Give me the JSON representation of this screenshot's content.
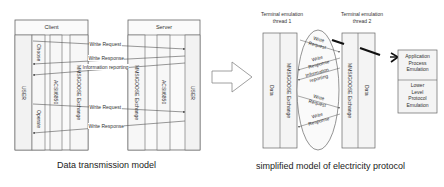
{
  "left_diagram": {
    "client": {
      "title": "Client",
      "columns": [
        "USER",
        "Choose",
        "Operate",
        "ACSI/6850",
        "MMS/GOOSE Exchange"
      ]
    },
    "server": {
      "title": "Server",
      "columns": [
        "MMS/GOOSE Exchange",
        "ACSI/6850",
        "USER"
      ]
    },
    "messages": [
      {
        "label": "Write Request",
        "direction": "client-to-server"
      },
      {
        "label": "Write Response",
        "direction": "server-to-client"
      },
      {
        "label": "Information reporting",
        "direction": "server-to-client"
      },
      {
        "label": "Write Request",
        "direction": "client-to-server"
      },
      {
        "label": "Write Response",
        "direction": "server-to-client"
      }
    ],
    "caption": "Data transmission model"
  },
  "transition_arrow": {
    "icon": "block-arrow-right-icon"
  },
  "right_diagram": {
    "thread1": {
      "title_line1": "Terminal emulation",
      "title_line2": "thread 1",
      "columns": [
        "Data",
        "MMS/GOOSE Exchange"
      ]
    },
    "thread2": {
      "title_line1": "Terminal emulation",
      "title_line2": "thread 2",
      "columns": [
        "MMS/GOOSE Exchange",
        "Data"
      ]
    },
    "ellipse_messages": [
      {
        "line1": "Write",
        "line2": "Request"
      },
      {
        "line1": "Write",
        "line2": "Response"
      },
      {
        "line1": "Information",
        "line2": "reporting"
      },
      {
        "line1": "Write",
        "line2": "Request"
      },
      {
        "line1": "Write",
        "line2": "Response"
      }
    ],
    "stack_box": {
      "top": [
        "Application",
        "Process",
        "Emulation"
      ],
      "bottom": [
        "Lower",
        "Level",
        "Protocol",
        "Emulation"
      ]
    },
    "caption": "simplified model of electricity protocol"
  },
  "colors": {
    "line": "#555555",
    "box_fill": "#f4f4f4",
    "background": "#ffffff",
    "thick_arrow": "#111111"
  }
}
